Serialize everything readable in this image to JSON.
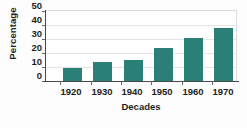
{
  "chart_data": {
    "type": "bar",
    "title": "",
    "xlabel": "Decades",
    "ylabel": "Percentage",
    "categories": [
      "1920",
      "1930",
      "1940",
      "1950",
      "1960",
      "1970"
    ],
    "values": [
      9,
      13.5,
      15,
      23,
      30,
      37
    ],
    "series": [
      {
        "name": "Percentage",
        "values": [
          9,
          13.5,
          15,
          23,
          30,
          37
        ]
      }
    ],
    "ylim": [
      0,
      50
    ],
    "yticks": [
      0,
      10,
      20,
      30,
      40,
      50
    ],
    "ytick_labels": [
      "0",
      "10",
      "20",
      "30",
      "40",
      "50"
    ],
    "grid": "horizontal",
    "legend": "none",
    "bar_color": "#2a8077",
    "gridline_color": "#e4e4e4",
    "axis_color": "#4a4a4a",
    "text_color": "#231f20",
    "background": "#ffffff"
  }
}
